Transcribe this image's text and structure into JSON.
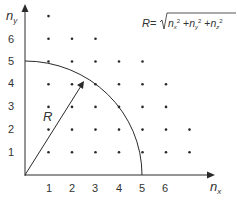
{
  "diagram": {
    "formula": {
      "lhs": "R",
      "eq": "=",
      "radicand": "n_x² + n_y² + n_z²",
      "text": "R = √(nx² + ny² + nz²)"
    },
    "axes": {
      "x_label": "n",
      "x_sub": "x",
      "y_label": "n",
      "y_sub": "y",
      "x_ticks": [
        "1",
        "2",
        "3",
        "4",
        "5",
        "6"
      ],
      "y_ticks": [
        "1",
        "2",
        "3",
        "4",
        "5",
        "6"
      ]
    },
    "radius_label": "R",
    "arc_radius_units": 5,
    "lattice_points": [
      {
        "row": 7,
        "cols": [
          1
        ]
      },
      {
        "row": 6,
        "cols": [
          1,
          2,
          3
        ]
      },
      {
        "row": 5,
        "cols": [
          1,
          2,
          3,
          4,
          5
        ]
      },
      {
        "row": 4,
        "cols": [
          1,
          2,
          3,
          4,
          5,
          6
        ]
      },
      {
        "row": 3,
        "cols": [
          1,
          2,
          3,
          4,
          5,
          6
        ]
      },
      {
        "row": 2,
        "cols": [
          1,
          2,
          3,
          4,
          5,
          6,
          7
        ]
      },
      {
        "row": 1,
        "cols": [
          1,
          2,
          3,
          4,
          5,
          6,
          7
        ]
      }
    ],
    "colors": {
      "ink": "#2a2a2a",
      "label": "#333333",
      "background": "#ffffff"
    }
  }
}
